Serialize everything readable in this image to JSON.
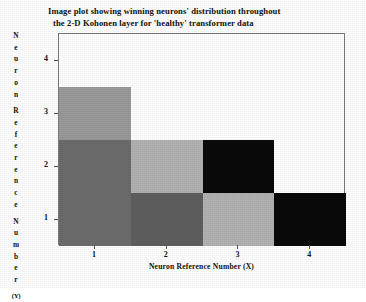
{
  "title": {
    "line1": "Image plot showing winning neurons' distribution throughout",
    "line2": "the 2-D Kohonen layer for 'healthy' transformer data"
  },
  "axes": {
    "x_title": "Neuron Reference Number (X)",
    "y_title_letters": [
      "N",
      "e",
      "u",
      "r",
      "o",
      "n",
      "",
      "R",
      "e",
      "f",
      "e",
      "r",
      "e",
      "n",
      "c",
      "e",
      "",
      "N",
      "u",
      "m",
      "b",
      "e",
      "r",
      "",
      "(Y)"
    ],
    "x_ticks": [
      "1",
      "2",
      "3",
      "4"
    ],
    "y_ticks": [
      "1",
      "2",
      "3",
      "4"
    ]
  },
  "chart_data": {
    "type": "heatmap",
    "title": "Image plot showing winning neurons' distribution throughout the 2-D Kohonen layer for 'healthy' transformer data",
    "xlabel": "Neuron Reference Number (X)",
    "ylabel": "Neuron Reference Number (Y)",
    "x": [
      1,
      2,
      3,
      4
    ],
    "y": [
      1,
      2,
      3,
      4
    ],
    "xlim": [
      0.5,
      4.5
    ],
    "ylim": [
      0.5,
      4.5
    ],
    "grid": false,
    "legend": "none",
    "colormap": "grayscale",
    "note": "Lighter cells indicate more winning neurons; black cells indicate none. Row 4 is entirely blank (white / no data).",
    "cells": [
      {
        "x": 1,
        "y": 4,
        "shade": "#ffffff",
        "label": "blank"
      },
      {
        "x": 2,
        "y": 4,
        "shade": "#ffffff",
        "label": "blank"
      },
      {
        "x": 3,
        "y": 4,
        "shade": "#ffffff",
        "label": "blank"
      },
      {
        "x": 4,
        "y": 4,
        "shade": "#ffffff",
        "label": "blank"
      },
      {
        "x": 1,
        "y": 3,
        "shade": "#9a9a9a",
        "label": "medium-gray"
      },
      {
        "x": 2,
        "y": 3,
        "shade": "#ffffff",
        "label": "blank"
      },
      {
        "x": 3,
        "y": 3,
        "shade": "#ffffff",
        "label": "blank"
      },
      {
        "x": 4,
        "y": 3,
        "shade": "#ffffff",
        "label": "blank"
      },
      {
        "x": 1,
        "y": 2,
        "shade": "#6c6c6c",
        "label": "dark-gray"
      },
      {
        "x": 2,
        "y": 2,
        "shade": "#b2b2b2",
        "label": "light-gray"
      },
      {
        "x": 3,
        "y": 2,
        "shade": "#0a0a0a",
        "label": "black"
      },
      {
        "x": 4,
        "y": 2,
        "shade": "#ffffff",
        "label": "blank"
      },
      {
        "x": 1,
        "y": 1,
        "shade": "#6c6c6c",
        "label": "dark-gray"
      },
      {
        "x": 2,
        "y": 1,
        "shade": "#5f5f5f",
        "label": "dark-gray"
      },
      {
        "x": 3,
        "y": 1,
        "shade": "#b2b2b2",
        "label": "light-gray"
      },
      {
        "x": 4,
        "y": 1,
        "shade": "#0a0a0a",
        "label": "black"
      }
    ],
    "values_matrix_rows_top_to_bottom": [
      [
        null,
        null,
        null,
        null
      ],
      [
        "#9a9a9a",
        null,
        null,
        null
      ],
      [
        "#6c6c6c",
        "#b2b2b2",
        "#0a0a0a",
        null
      ],
      [
        "#6c6c6c",
        "#5f5f5f",
        "#b2b2b2",
        "#0a0a0a"
      ]
    ]
  }
}
